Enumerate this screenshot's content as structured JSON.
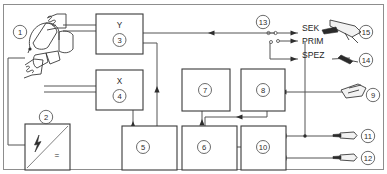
{
  "diagram": {
    "frame_visible": true,
    "blocks": [
      {
        "id": "3",
        "letter": "Y",
        "name": "block-y-3"
      },
      {
        "id": "4",
        "letter": "X",
        "name": "block-x-4"
      },
      {
        "id": "5",
        "letter": "",
        "name": "block-5"
      },
      {
        "id": "6",
        "letter": "",
        "name": "block-6"
      },
      {
        "id": "7",
        "letter": "",
        "name": "block-7"
      },
      {
        "id": "8",
        "letter": "",
        "name": "block-8"
      },
      {
        "id": "10",
        "letter": "",
        "name": "block-10"
      }
    ],
    "callouts": [
      {
        "id": "1",
        "name": "callout-1-torch"
      },
      {
        "id": "2",
        "name": "callout-2-power-supply"
      },
      {
        "id": "3",
        "name": "callout-3"
      },
      {
        "id": "4",
        "name": "callout-4"
      },
      {
        "id": "5",
        "name": "callout-5"
      },
      {
        "id": "6",
        "name": "callout-6"
      },
      {
        "id": "7",
        "name": "callout-7"
      },
      {
        "id": "8",
        "name": "callout-8"
      },
      {
        "id": "9",
        "name": "callout-9"
      },
      {
        "id": "10",
        "name": "callout-10"
      },
      {
        "id": "11",
        "name": "callout-11"
      },
      {
        "id": "12",
        "name": "callout-12"
      },
      {
        "id": "13",
        "name": "callout-13-switch"
      },
      {
        "id": "14",
        "name": "callout-14"
      },
      {
        "id": "15",
        "name": "callout-15"
      }
    ],
    "port_labels": [
      {
        "key": "sek",
        "text": "SEK"
      },
      {
        "key": "prim",
        "text": "PRIM"
      },
      {
        "key": "spez",
        "text": "SPEZ"
      }
    ],
    "power_symbol": {
      "ac": "lightning-bolt",
      "dc": "="
    },
    "colors": {
      "background": "#ffffff",
      "block_stroke": "#3a3a3a",
      "wire": "#555555",
      "label_text": "#1f1f1f",
      "frame": "#8d8d8d"
    }
  }
}
